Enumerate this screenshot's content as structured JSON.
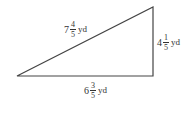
{
  "figure": {
    "shape": "right-triangle",
    "stroke_color": "#444444",
    "hypotenuse": {
      "whole": "7",
      "numerator": "4",
      "denominator": "5",
      "unit": "yd"
    },
    "right_side": {
      "whole": "4",
      "numerator": "1",
      "denominator": "5",
      "unit": "yd"
    },
    "bottom_side": {
      "whole": "6",
      "numerator": "3",
      "denominator": "5",
      "unit": "yd"
    }
  }
}
